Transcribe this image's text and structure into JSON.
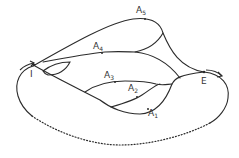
{
  "diagram": {
    "type": "path-network",
    "stroke_color": "#2b2b2b",
    "nodes": [
      {
        "id": "I",
        "label": "I"
      },
      {
        "id": "E",
        "label": "E"
      }
    ],
    "arcs": [
      {
        "id": "A1",
        "label": "A",
        "subscript": "1"
      },
      {
        "id": "A2",
        "label": "A",
        "subscript": "2"
      },
      {
        "id": "A3",
        "label": "A",
        "subscript": "3"
      },
      {
        "id": "A4",
        "label": "A",
        "subscript": "4"
      },
      {
        "id": "A5",
        "label": "A",
        "subscript": "5"
      }
    ],
    "outer_loop": {
      "style_bottom": "dotted",
      "arrow_at_I": "right",
      "arrow_at_E": "right"
    }
  }
}
